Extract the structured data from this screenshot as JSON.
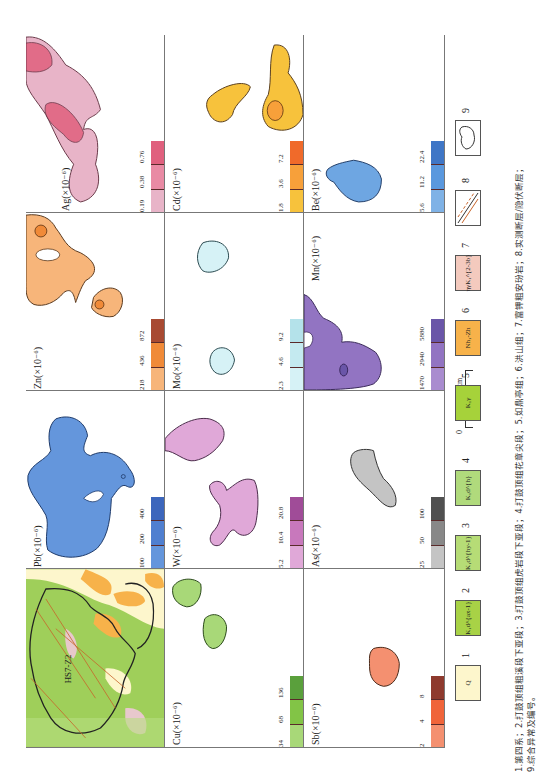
{
  "figure": {
    "panels": [
      {
        "id": "ag",
        "element": "Ag",
        "label": "Ag(×10⁻⁶)",
        "ticks": [
          "0.19",
          "0.38",
          "0.76"
        ],
        "colors": [
          "#e8b4c8",
          "#e98aa4",
          "#e0607e"
        ]
      },
      {
        "id": "cd",
        "element": "Cd",
        "label": "Cd(×10⁻⁶)",
        "ticks": [
          "1.8",
          "3.6",
          "7.2"
        ],
        "colors": [
          "#f7c23c",
          "#f7a03a",
          "#f06a2a"
        ]
      },
      {
        "id": "be",
        "element": "Be",
        "label": "Be(×10⁻⁶)",
        "ticks": [
          "5.6",
          "11.2",
          "22.4"
        ],
        "colors": [
          "#7fb2e6",
          "#5a98de",
          "#3f76c6"
        ]
      },
      {
        "id": "zn",
        "element": "Zn",
        "label": "Zn(×10⁻⁶)",
        "ticks": [
          "218",
          "436",
          "872"
        ],
        "colors": [
          "#f7b57a",
          "#f08a38",
          "#a84a32"
        ]
      },
      {
        "id": "mo",
        "element": "Mo",
        "label": "Mo(×10⁻⁶)",
        "ticks": [
          "2.3",
          "4.6",
          "9.2"
        ],
        "colors": [
          "#d6f2f6",
          "#c4eaf0",
          "#b4e2ea"
        ]
      },
      {
        "id": "mn",
        "element": "Mn",
        "label": "Mn(×10⁻⁶)",
        "ticks": [
          "1470",
          "2940",
          "5880"
        ],
        "colors": [
          "#a98ccf",
          "#9274c2",
          "#6a56a8"
        ]
      },
      {
        "id": "pb",
        "element": "Pb",
        "label": "Pb(×10⁻⁶)",
        "ticks": [
          "100",
          "200",
          "400"
        ],
        "colors": [
          "#6496dc",
          "#4f7fd0",
          "#3c66bc"
        ]
      },
      {
        "id": "w",
        "element": "W",
        "label": "W(×10⁻⁶)",
        "ticks": [
          "5.2",
          "10.4",
          "20.8"
        ],
        "colors": [
          "#e0a8d8",
          "#c878bc",
          "#a04c98"
        ]
      },
      {
        "id": "as",
        "element": "As",
        "label": "As(×10⁻⁶)",
        "ticks": [
          "25",
          "50",
          "100"
        ],
        "colors": [
          "#c4c4c4",
          "#888888",
          "#505050"
        ]
      },
      {
        "id": "geo",
        "element": "Geology",
        "label": "",
        "ticks": [],
        "colors": []
      },
      {
        "id": "cu",
        "element": "Cu",
        "label": "Cu(×10⁻⁶)",
        "ticks": [
          "34",
          "68",
          "136"
        ],
        "colors": [
          "#a8d878",
          "#82c446",
          "#5aa03c"
        ]
      },
      {
        "id": "sb",
        "element": "Sb",
        "label": "Sb(×10⁻⁶)",
        "ticks": [
          "2",
          "4",
          "8"
        ],
        "colors": [
          "#f49070",
          "#f0643a",
          "#8e3a2e"
        ]
      }
    ],
    "geology_map": {
      "anomaly_id": "HS7-Z2",
      "unit_labels": [
        "Nh1-Zh",
        "Nh1-Zh",
        "Nh1-Zh",
        "K1d2ax-1",
        "K1d2ax-1",
        "ηγK1",
        "ηγK1",
        "ηγK1",
        "K1γ"
      ]
    },
    "scale_bar": {
      "start": "0",
      "end": "1.5km"
    },
    "legend": [
      {
        "num": "1",
        "code": "Q",
        "color": "#fdf6cc"
      },
      {
        "num": "2",
        "code": "K₁d^{ax-1}",
        "color": "#a8d246"
      },
      {
        "num": "3",
        "code": "K₁d^{hy-1}",
        "color": "#b6dc76"
      },
      {
        "num": "4",
        "code": "K₁d^{h}",
        "color": "#b0da7c"
      },
      {
        "num": "5",
        "code": "K₁γ",
        "color": "#a6d23a"
      },
      {
        "num": "6",
        "code": "Nh₁-Zh",
        "color": "#f7b24a"
      },
      {
        "num": "7",
        "code": "ηγK₁^{2-3b}",
        "color": "#f4cabe"
      },
      {
        "num": "8",
        "code": "faults",
        "color": "#ffffff"
      },
      {
        "num": "9",
        "code": "HS7-Z2",
        "color": "#ffffff"
      }
    ],
    "caption_line1": "1.第四系；2.打鼓顶组粗溪段下亚段；3.打鼓顶组虎岩段下亚段；4.打鼓顶组花章尖段；5.如鼎亭组；6.洪山组；7.富钾粗安玢岩；8.实测断层/隐伏断层；",
    "caption_line2": "9.综合异常及编号。"
  }
}
